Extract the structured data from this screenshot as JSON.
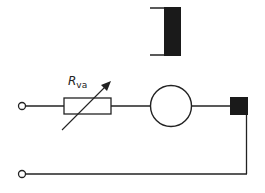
{
  "diagram": {
    "type": "circuit-schematic",
    "colors": {
      "line": "#222222",
      "fill": "#1a1a1a",
      "background": "#ffffff"
    },
    "components": [
      {
        "id": "field-winding-symbol",
        "kind": "winding-bracket",
        "position": "top"
      },
      {
        "id": "terminal-top",
        "kind": "terminal"
      },
      {
        "id": "variable-resistor",
        "kind": "variable-resistor",
        "label_main": "R",
        "label_sub": "va"
      },
      {
        "id": "machine",
        "kind": "circle-machine"
      },
      {
        "id": "winding-block",
        "kind": "filled-square"
      },
      {
        "id": "terminal-bottom",
        "kind": "terminal"
      }
    ],
    "resistor_label": {
      "main": "R",
      "sub": "va"
    }
  }
}
